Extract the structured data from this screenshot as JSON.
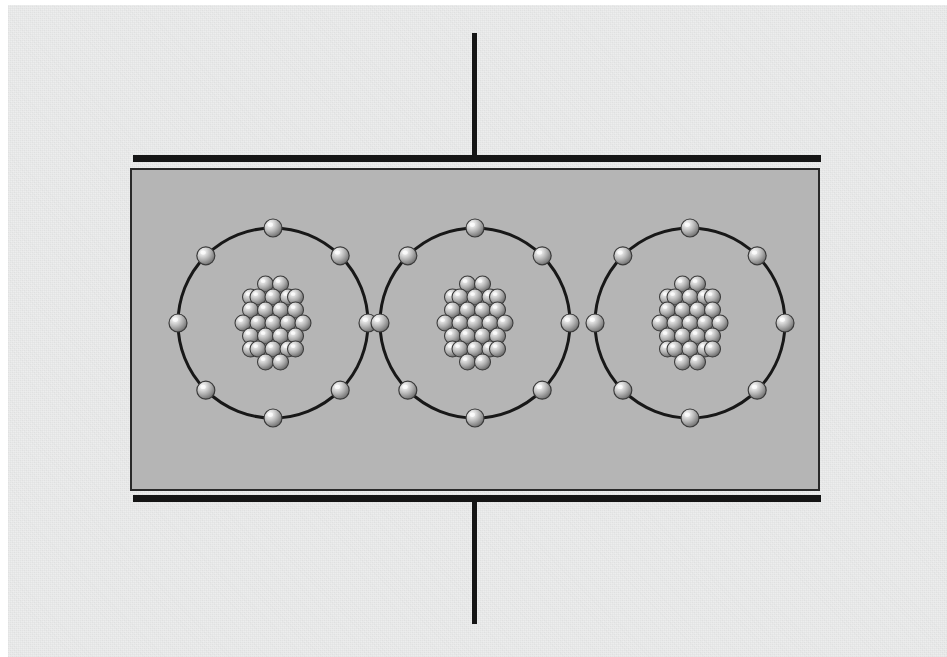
{
  "figure": {
    "domain_kind": "diagram",
    "width": 947,
    "height": 657
  },
  "colors": {
    "page_background": "#ffffff",
    "paper_background": "#eceded",
    "dielectric_fill": "#b5b5b5",
    "dielectric_border": "#2a2a2a",
    "plate_color": "#151515",
    "lead_wire_color": "#151515",
    "orbit_stroke": "#181818",
    "sphere_light": "#f2f2f2",
    "sphere_mid": "#b8b8b8",
    "sphere_dark": "#6e6e6e",
    "sphere_outline": "#3a3a3a"
  },
  "capacitor": {
    "top_plate": {
      "label": "top capacitor plate",
      "x": 133,
      "y": 155,
      "width": 688,
      "height": 7
    },
    "bottom_plate": {
      "label": "bottom capacitor plate",
      "x": 133,
      "y": 495,
      "width": 688,
      "height": 7
    },
    "top_lead": {
      "label": "top lead wire",
      "x": 472,
      "y": 33,
      "width": 5,
      "height": 123
    },
    "bottom_lead": {
      "label": "bottom lead wire",
      "x": 472,
      "y": 501,
      "width": 5,
      "height": 123
    },
    "dielectric_slab": {
      "label": "dielectric slab",
      "x": 131,
      "y": 169,
      "width": 688,
      "height": 321,
      "border_width": 2
    }
  },
  "atoms": [
    {
      "name": "atom-1",
      "center_x": 273,
      "center_y": 323,
      "orbit_radius": 95,
      "orbit_stroke_width": 3,
      "electron_count": 8,
      "electron_radius": 9,
      "electron_angles_deg": [
        270,
        315,
        0,
        45,
        90,
        135,
        180,
        225
      ],
      "nucleus_radius": 38,
      "nucleon_count": 27,
      "nucleon_radius": 8
    },
    {
      "name": "atom-2",
      "center_x": 475,
      "center_y": 323,
      "orbit_radius": 95,
      "orbit_stroke_width": 3,
      "electron_count": 8,
      "electron_radius": 9,
      "electron_angles_deg": [
        270,
        315,
        0,
        45,
        90,
        135,
        180,
        225
      ],
      "nucleus_radius": 38,
      "nucleon_count": 27,
      "nucleon_radius": 8
    },
    {
      "name": "atom-3",
      "center_x": 690,
      "center_y": 323,
      "orbit_radius": 95,
      "orbit_stroke_width": 3,
      "electron_count": 8,
      "electron_radius": 9,
      "electron_angles_deg": [
        270,
        315,
        0,
        45,
        90,
        135,
        180,
        225
      ],
      "nucleus_radius": 38,
      "nucleon_count": 27,
      "nucleon_radius": 8
    }
  ],
  "nucleon_layout": [
    {
      "dx": 0,
      "dy": 0
    },
    {
      "dx": 15,
      "dy": 0
    },
    {
      "dx": -15,
      "dy": 0
    },
    {
      "dx": 7.5,
      "dy": -13
    },
    {
      "dx": -7.5,
      "dy": -13
    },
    {
      "dx": 7.5,
      "dy": 13
    },
    {
      "dx": -7.5,
      "dy": 13
    },
    {
      "dx": 22.5,
      "dy": -13
    },
    {
      "dx": -22.5,
      "dy": -13
    },
    {
      "dx": 22.5,
      "dy": 13
    },
    {
      "dx": -22.5,
      "dy": 13
    },
    {
      "dx": 0,
      "dy": -26
    },
    {
      "dx": 15,
      "dy": -26
    },
    {
      "dx": -15,
      "dy": -26
    },
    {
      "dx": 0,
      "dy": 26
    },
    {
      "dx": 15,
      "dy": 26
    },
    {
      "dx": -15,
      "dy": 26
    },
    {
      "dx": 30,
      "dy": 0
    },
    {
      "dx": -30,
      "dy": 0
    },
    {
      "dx": 7.5,
      "dy": -39
    },
    {
      "dx": -7.5,
      "dy": -39
    },
    {
      "dx": 7.5,
      "dy": 39
    },
    {
      "dx": -7.5,
      "dy": 39
    },
    {
      "dx": 22.5,
      "dy": 26
    },
    {
      "dx": -22.5,
      "dy": 26
    },
    {
      "dx": 22.5,
      "dy": -26
    },
    {
      "dx": -22.5,
      "dy": -26
    }
  ]
}
